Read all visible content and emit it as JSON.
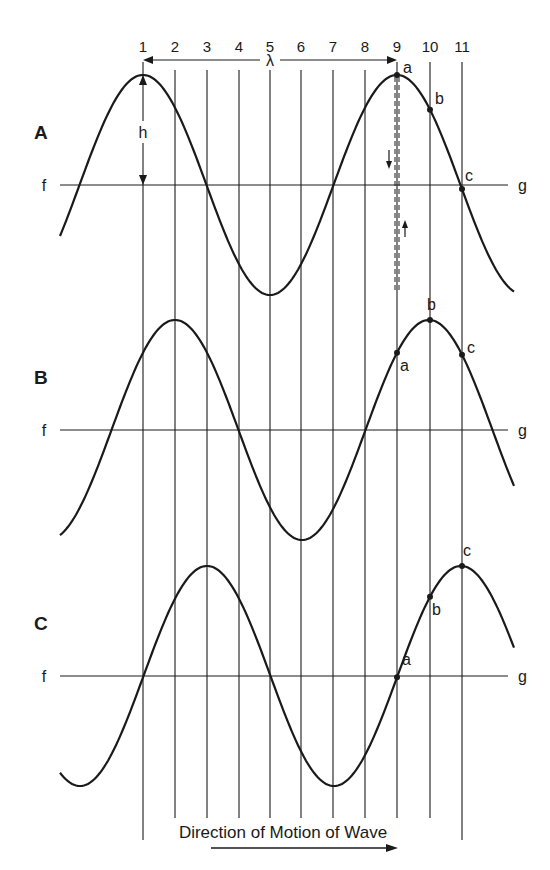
{
  "figure": {
    "column_numbers": [
      "1",
      "2",
      "3",
      "4",
      "5",
      "6",
      "7",
      "8",
      "9",
      "10",
      "11"
    ],
    "column_x": [
      143,
      175,
      207,
      239,
      270,
      301,
      333,
      365,
      397,
      430,
      462
    ],
    "wavelength_label": "λ",
    "height_label": "h",
    "rows": [
      {
        "id": "A",
        "label": "A",
        "axis_left": "f",
        "axis_right": "g",
        "axis_y": 185,
        "crest_x": 143,
        "points": [
          {
            "label": "a",
            "col": 9
          },
          {
            "label": "b",
            "col": 10
          },
          {
            "label": "c",
            "col": 11
          }
        ]
      },
      {
        "id": "B",
        "label": "B",
        "axis_left": "f",
        "axis_right": "g",
        "axis_y": 430,
        "crest_x": 175,
        "points": [
          {
            "label": "a",
            "col": 9
          },
          {
            "label": "b",
            "col": 10
          },
          {
            "label": "c",
            "col": 11
          }
        ]
      },
      {
        "id": "C",
        "label": "C",
        "axis_left": "f",
        "axis_right": "g",
        "axis_y": 676,
        "crest_x": 207,
        "points": [
          {
            "label": "a",
            "col": 9
          },
          {
            "label": "b",
            "col": 10
          },
          {
            "label": "c",
            "col": 11
          }
        ]
      }
    ],
    "amplitude_px": 110,
    "wavelength_px": 254,
    "caption": "Direction of Motion of Wave",
    "colors": {
      "ink": "#1a1a1a",
      "background": "#ffffff"
    }
  }
}
